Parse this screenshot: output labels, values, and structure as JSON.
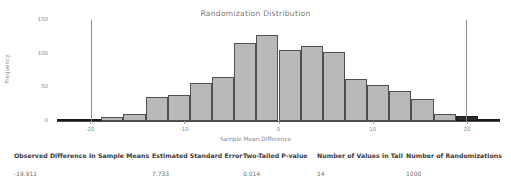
{
  "chart_data": {
    "type": "bar",
    "title": "Randomization Distribution",
    "xlabel": "Sample Mean Difference",
    "ylabel": "Frequency",
    "xlim": [
      -23.5,
      23.5
    ],
    "ylim": [
      0,
      150
    ],
    "grid": false,
    "legend": null,
    "bin_width": 2.35,
    "x_ticks": [
      "-20",
      "-10",
      "0",
      "10",
      "20"
    ],
    "x_tick_values": [
      -20,
      -10,
      0,
      10,
      20
    ],
    "y_ticks": [
      "0",
      "50",
      "100",
      "150"
    ],
    "y_tick_values": [
      0,
      50,
      100,
      150
    ],
    "bar_fill_color": "#b9b9b9",
    "bar_edge_color": "#4f4f4f",
    "tail_fill_color": "#2b2b2b",
    "reference_line_color": "#8c8c8c",
    "reference_lines": [
      -19.911,
      19.911
    ],
    "bins": [
      {
        "x_left": -23.5,
        "x_right": -21.15,
        "value": 2,
        "tail": true
      },
      {
        "x_left": -21.15,
        "x_right": -18.8,
        "value": 3,
        "tail": true
      },
      {
        "x_left": -18.8,
        "x_right": -16.45,
        "value": 6,
        "tail": false
      },
      {
        "x_left": -16.45,
        "x_right": -14.1,
        "value": 11,
        "tail": false
      },
      {
        "x_left": -14.1,
        "x_right": -11.75,
        "value": 35,
        "tail": false
      },
      {
        "x_left": -11.75,
        "x_right": -9.4,
        "value": 38,
        "tail": false
      },
      {
        "x_left": -9.4,
        "x_right": -7.05,
        "value": 57,
        "tail": false
      },
      {
        "x_left": -7.05,
        "x_right": -4.7,
        "value": 66,
        "tail": false
      },
      {
        "x_left": -4.7,
        "x_right": -2.35,
        "value": 116,
        "tail": false
      },
      {
        "x_left": -2.35,
        "x_right": 0.0,
        "value": 128,
        "tail": false
      },
      {
        "x_left": 0.0,
        "x_right": 2.35,
        "value": 105,
        "tail": false
      },
      {
        "x_left": 2.35,
        "x_right": 4.7,
        "value": 111,
        "tail": false
      },
      {
        "x_left": 4.7,
        "x_right": 7.05,
        "value": 103,
        "tail": false
      },
      {
        "x_left": 7.05,
        "x_right": 9.4,
        "value": 63,
        "tail": false
      },
      {
        "x_left": 9.4,
        "x_right": 11.75,
        "value": 53,
        "tail": false
      },
      {
        "x_left": 11.75,
        "x_right": 14.1,
        "value": 45,
        "tail": false
      },
      {
        "x_left": 14.1,
        "x_right": 16.45,
        "value": 32,
        "tail": false
      },
      {
        "x_left": 16.45,
        "x_right": 18.8,
        "value": 10,
        "tail": false
      },
      {
        "x_left": 18.8,
        "x_right": 21.15,
        "value": 8,
        "tail": true
      },
      {
        "x_left": 21.15,
        "x_right": 23.5,
        "value": 3,
        "tail": true
      }
    ]
  },
  "stats_table": {
    "columns": [
      {
        "header": "Observed Difference In Sample Means",
        "value": "-19.911",
        "left_px": 14,
        "header_width": 132
      },
      {
        "header": "Estimated Standard Error",
        "value": "7.733",
        "left_px": 152,
        "header_width": 92
      },
      {
        "header": "Two-Tailed P-value",
        "value": "0.014",
        "left_px": 243,
        "header_width": 70
      },
      {
        "header": "Number of Values in Tail",
        "value": "14",
        "left_px": 317,
        "header_width": 88
      },
      {
        "header": "Number of Randomizations",
        "value": "1000",
        "left_px": 406,
        "header_width": 100
      }
    ]
  }
}
